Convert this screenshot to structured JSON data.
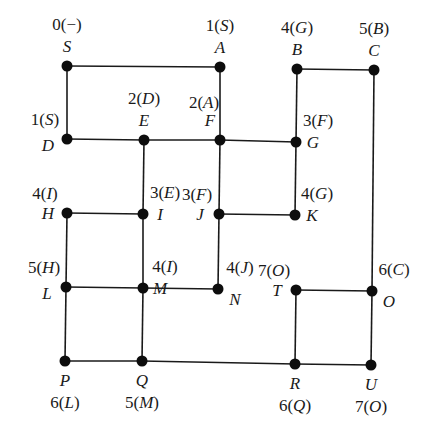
{
  "diagram": {
    "type": "graph",
    "colors": {
      "edge": "#1a1a1a",
      "node": "#0d0d0d",
      "background": "#ffffff"
    },
    "nodes": [
      {
        "id": "S",
        "x": 67,
        "y": 66,
        "label": "0(−)",
        "label_parts": [
          "0(",
          "−",
          ")"
        ],
        "name_pos": "above",
        "label_pos": "above"
      },
      {
        "id": "A",
        "x": 220,
        "y": 67,
        "label": "1(S)",
        "label_parts": [
          "1(",
          "S",
          ")"
        ],
        "name_pos": "above",
        "label_pos": "above"
      },
      {
        "id": "B",
        "x": 297,
        "y": 69,
        "label": "4(G)",
        "label_parts": [
          "4(",
          "G",
          ")"
        ],
        "name_pos": "above",
        "label_pos": "above"
      },
      {
        "id": "C",
        "x": 374,
        "y": 70,
        "label": "5(B)",
        "label_parts": [
          "5(",
          "B",
          ")"
        ],
        "name_pos": "above",
        "label_pos": "above"
      },
      {
        "id": "D",
        "x": 67,
        "y": 139,
        "label": "1(S)",
        "label_parts": [
          "1(",
          "S",
          ")"
        ],
        "name_pos": "left-below",
        "label_pos": "left-above"
      },
      {
        "id": "E",
        "x": 144,
        "y": 140,
        "label": "2(D)",
        "label_parts": [
          "2(",
          "D",
          ")"
        ],
        "name_pos": "above",
        "label_pos": "above"
      },
      {
        "id": "F",
        "x": 220,
        "y": 140,
        "label": "2(A)",
        "label_parts": [
          "2(",
          "A",
          ")"
        ],
        "name_pos": "above-left",
        "label_pos": "above-left"
      },
      {
        "id": "G",
        "x": 296,
        "y": 142,
        "label": "3(F)",
        "label_parts": [
          "3(",
          "F",
          ")"
        ],
        "name_pos": "right",
        "label_pos": "right-above"
      },
      {
        "id": "H",
        "x": 67,
        "y": 213,
        "label": "4(I)",
        "label_parts": [
          "4(",
          "I",
          ")"
        ],
        "name_pos": "left",
        "label_pos": "left-above"
      },
      {
        "id": "I",
        "x": 143,
        "y": 214,
        "label": "3(E)",
        "label_parts": [
          "3(",
          "E",
          ")"
        ],
        "name_pos": "right",
        "label_pos": "right-above"
      },
      {
        "id": "J",
        "x": 219,
        "y": 214,
        "label": "3(F)",
        "label_parts": [
          "3(",
          "F",
          ")"
        ],
        "name_pos": "left",
        "label_pos": "left-above"
      },
      {
        "id": "K",
        "x": 295,
        "y": 215,
        "label": "4(G)",
        "label_parts": [
          "4(",
          "G",
          ")"
        ],
        "name_pos": "right",
        "label_pos": "right-above"
      },
      {
        "id": "L",
        "x": 66,
        "y": 287,
        "label": "5(H)",
        "label_parts": [
          "5(",
          "H",
          ")"
        ],
        "name_pos": "left-below",
        "label_pos": "left-above"
      },
      {
        "id": "M",
        "x": 143,
        "y": 288,
        "label": "4(I)",
        "label_parts": [
          "4(",
          "I",
          ")"
        ],
        "name_pos": "right",
        "label_pos": "right-above"
      },
      {
        "id": "N",
        "x": 218,
        "y": 289,
        "label": "4(J)",
        "label_parts": [
          "4(",
          "J",
          ")"
        ],
        "name_pos": "right-below",
        "label_pos": "right-above"
      },
      {
        "id": "T",
        "x": 296,
        "y": 290,
        "label": "7(O)",
        "label_parts": [
          "7(",
          "O",
          ")"
        ],
        "name_pos": "left",
        "label_pos": "left-above"
      },
      {
        "id": "O",
        "x": 372,
        "y": 291,
        "label": "6(C)",
        "label_parts": [
          "6(",
          "C",
          ")"
        ],
        "name_pos": "right-below",
        "label_pos": "right-above"
      },
      {
        "id": "P",
        "x": 65,
        "y": 361,
        "label": "6(L)",
        "label_parts": [
          "6(",
          "L",
          ")"
        ],
        "name_pos": "below",
        "label_pos": "below"
      },
      {
        "id": "Q",
        "x": 142,
        "y": 361,
        "label": "5(M)",
        "label_parts": [
          "5(",
          "M",
          ")"
        ],
        "name_pos": "below",
        "label_pos": "below"
      },
      {
        "id": "R",
        "x": 295,
        "y": 364,
        "label": "6(Q)",
        "label_parts": [
          "6(",
          "Q",
          ")"
        ],
        "name_pos": "below",
        "label_pos": "below"
      },
      {
        "id": "U",
        "x": 371,
        "y": 365,
        "label": "7(O)",
        "label_parts": [
          "7(",
          "O",
          ")"
        ],
        "name_pos": "below",
        "label_pos": "below"
      }
    ],
    "edges": [
      [
        "S",
        "A"
      ],
      [
        "S",
        "D"
      ],
      [
        "A",
        "F"
      ],
      [
        "B",
        "C"
      ],
      [
        "B",
        "G"
      ],
      [
        "C",
        "O"
      ],
      [
        "D",
        "E"
      ],
      [
        "E",
        "F"
      ],
      [
        "F",
        "G"
      ],
      [
        "E",
        "I"
      ],
      [
        "F",
        "J"
      ],
      [
        "G",
        "K"
      ],
      [
        "H",
        "I"
      ],
      [
        "J",
        "K"
      ],
      [
        "H",
        "L"
      ],
      [
        "I",
        "M"
      ],
      [
        "J",
        "N"
      ],
      [
        "L",
        "M"
      ],
      [
        "M",
        "N"
      ],
      [
        "T",
        "O"
      ],
      [
        "L",
        "P"
      ],
      [
        "M",
        "Q"
      ],
      [
        "T",
        "R"
      ],
      [
        "O",
        "U"
      ],
      [
        "P",
        "Q"
      ],
      [
        "Q",
        "R"
      ],
      [
        "R",
        "U"
      ]
    ]
  }
}
